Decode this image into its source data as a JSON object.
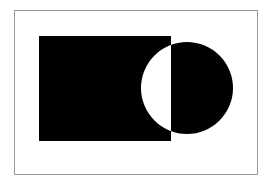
{
  "canvas": {
    "width": 270,
    "height": 182,
    "background": "#ffffff"
  },
  "frame": {
    "x": 14.5,
    "y": 10.5,
    "width": 243,
    "height": 164,
    "stroke": "#9a9a9a",
    "stroke_width": 1
  },
  "shapes": {
    "fill": "#000000",
    "fill_rule": "evenodd",
    "rectangle": {
      "x": 39,
      "y": 36,
      "width": 132,
      "height": 105
    },
    "circle": {
      "cx": 187,
      "cy": 88,
      "r": 46
    },
    "overlap_rendering": "xor (overlap shown white)"
  }
}
